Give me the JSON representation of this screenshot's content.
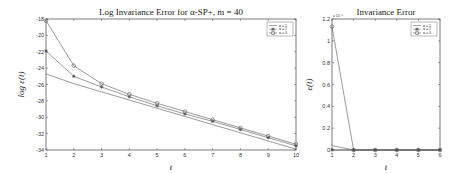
{
  "chart_data": [
    {
      "type": "line",
      "title": "Log Invariance Error for α-SP+, m = 40",
      "xlabel": "t",
      "ylabel": "log ε(t)",
      "x": [
        1,
        2,
        3,
        4,
        5,
        6,
        7,
        8,
        9,
        10
      ],
      "xlim": [
        1,
        10
      ],
      "ylim": [
        -34,
        -18
      ],
      "yticks": [
        -18,
        -20,
        -22,
        -24,
        -26,
        -28,
        -30,
        -32,
        -34
      ],
      "xticks": [
        1,
        2,
        3,
        4,
        5,
        6,
        7,
        8,
        9,
        10
      ],
      "legend_position": "upper right",
      "grid": false,
      "series": [
        {
          "name": "α = 1",
          "marker": "none",
          "values": [
            -24.7,
            -25.9,
            -26.9,
            -27.9,
            -28.9,
            -29.9,
            -30.9,
            -31.9,
            -32.9,
            -33.9
          ]
        },
        {
          "name": "α = 2",
          "marker": "star",
          "values": [
            -21.9,
            -25.0,
            -26.3,
            -27.5,
            -28.6,
            -29.6,
            -30.5,
            -31.5,
            -32.5,
            -33.5
          ]
        },
        {
          "name": "α = 3",
          "marker": "circle",
          "values": [
            -18.2,
            -23.7,
            -25.9,
            -27.2,
            -28.3,
            -29.3,
            -30.3,
            -31.3,
            -32.3,
            -33.3
          ]
        }
      ]
    },
    {
      "type": "line",
      "title": "Invariance Error",
      "xlabel": "t",
      "ylabel": "ε(t)",
      "yscale_label": "x 10^-8",
      "x": [
        1,
        2,
        3,
        4,
        5,
        6
      ],
      "xlim": [
        1,
        6
      ],
      "ylim": [
        0,
        1.2
      ],
      "yticks": [
        0,
        0.2,
        0.4,
        0.6,
        0.8,
        1,
        1.2
      ],
      "xticks": [
        1,
        2,
        3,
        4,
        5,
        6
      ],
      "legend_position": "upper right",
      "grid": false,
      "series": [
        {
          "name": "α = 1",
          "marker": "none",
          "values": [
            0.04,
            0.0,
            0.0,
            0.0,
            0.0,
            0.0
          ]
        },
        {
          "name": "α = 2",
          "marker": "star",
          "values": [
            0.0,
            0.0,
            0.0,
            0.0,
            0.0,
            0.0
          ]
        },
        {
          "name": "α = 3",
          "marker": "circle",
          "values": [
            1.13,
            0.0,
            0.0,
            0.0,
            0.0,
            0.0
          ]
        }
      ]
    }
  ]
}
